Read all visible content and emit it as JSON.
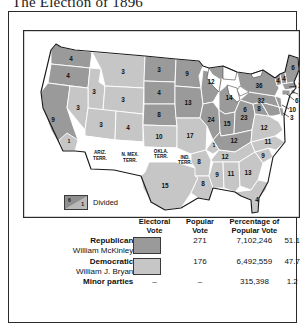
{
  "title": "The Election of 1896",
  "legend": {
    "divided_label": "Divided",
    "divided_swatch_numbers": [
      "6",
      "1"
    ]
  },
  "colors": {
    "republican": "#9a9a9a",
    "democratic": "#c6c6c6",
    "territory": "#ffffff",
    "border": "#2a2a2a",
    "water": "#ffffff"
  },
  "table": {
    "headers": {
      "party": "",
      "electoral_vote": "Electoral Vote",
      "electoral_vote_l1": "Electoral",
      "electoral_vote_l2": "Vote",
      "popular_vote_l1": "Popular",
      "popular_vote_l2": "Vote",
      "percentage_l1": "Percentage of",
      "percentage_l2": "Popular Vote"
    },
    "rows": [
      {
        "party": "Republican",
        "candidate": "William McKinley",
        "swatch": "republican",
        "electoral_vote": "271",
        "popular_vote": "7,102,246",
        "percentage": "51.1"
      },
      {
        "party": "Democratic",
        "candidate": "William J. Bryan",
        "swatch": "democratic",
        "electoral_vote": "176",
        "popular_vote": "6,492,559",
        "percentage": "47.7"
      }
    ],
    "minor": {
      "label": "Minor parties",
      "swatch_dash": "–",
      "electoral_vote": "–",
      "popular_vote": "315,398",
      "percentage": "1.2"
    }
  },
  "map": {
    "type": "electoral-vote-choropleth",
    "states": [
      {
        "code": "WA",
        "votes": "4",
        "party": "republican",
        "x": 57,
        "y": 39
      },
      {
        "code": "OR",
        "votes": "4",
        "party": "republican",
        "x": 43,
        "y": 64
      },
      {
        "code": "ID",
        "votes": "3",
        "party": "democratic",
        "x": 72,
        "y": 66
      },
      {
        "code": "MT",
        "votes": "3",
        "party": "democratic",
        "x": 98,
        "y": 50
      },
      {
        "code": "ND",
        "votes": "3",
        "party": "republican",
        "x": 133,
        "y": 46
      },
      {
        "code": "SD",
        "votes": "4",
        "party": "republican",
        "x": 135,
        "y": 68
      },
      {
        "code": "NE",
        "votes": "8",
        "party": "republican",
        "x": 137,
        "y": 90
      },
      {
        "code": "WY",
        "votes": "3",
        "party": "democratic",
        "x": 101,
        "y": 76
      },
      {
        "code": "NV",
        "votes": "3",
        "party": "democratic",
        "x": 55,
        "y": 93
      },
      {
        "code": "UT",
        "votes": "3",
        "party": "democratic",
        "x": 80,
        "y": 100
      },
      {
        "code": "CO",
        "votes": "4",
        "party": "democratic",
        "x": 105,
        "y": 102
      },
      {
        "code": "CA",
        "votes": "9",
        "party": "republican",
        "x": 33,
        "y": 108
      },
      {
        "code": "CA-d",
        "votes": "1",
        "party": "democratic",
        "x": 51,
        "y": 125
      },
      {
        "code": "KS",
        "votes": "10",
        "party": "democratic",
        "x": 137,
        "y": 110
      },
      {
        "code": "MN",
        "votes": "9",
        "party": "republican",
        "x": 163,
        "y": 42
      },
      {
        "code": "IA",
        "votes": "13",
        "party": "republican",
        "x": 165,
        "y": 78
      },
      {
        "code": "MO",
        "votes": "17",
        "party": "democratic",
        "x": 168,
        "y": 110
      },
      {
        "code": "WI",
        "votes": "12",
        "party": "republican",
        "x": 182,
        "y": 48
      },
      {
        "code": "IL",
        "votes": "24",
        "party": "republican",
        "x": 187,
        "y": 88
      },
      {
        "code": "MI",
        "votes": "14",
        "party": "republican",
        "x": 208,
        "y": 66
      },
      {
        "code": "IN",
        "votes": "15",
        "party": "republican",
        "x": 203,
        "y": 92
      },
      {
        "code": "OH",
        "votes": "23",
        "party": "republican",
        "x": 220,
        "y": 89
      },
      {
        "code": "KY",
        "votes": "12",
        "party": "republican",
        "x": 208,
        "y": 116
      },
      {
        "code": "KY-d",
        "votes": "1",
        "party": "democratic",
        "x": 193,
        "y": 114
      },
      {
        "code": "TN",
        "votes": "12",
        "party": "democratic",
        "x": 198,
        "y": 129
      },
      {
        "code": "TX",
        "votes": "15",
        "party": "democratic",
        "x": 140,
        "y": 160
      },
      {
        "code": "AR",
        "votes": "8",
        "party": "democratic",
        "x": 176,
        "y": 136
      },
      {
        "code": "LA",
        "votes": "8",
        "party": "democratic",
        "x": 179,
        "y": 158
      },
      {
        "code": "MS",
        "votes": "9",
        "party": "democratic",
        "x": 195,
        "y": 152
      },
      {
        "code": "AL",
        "votes": "11",
        "party": "democratic",
        "x": 209,
        "y": 150
      },
      {
        "code": "GA",
        "votes": "13",
        "party": "democratic",
        "x": 225,
        "y": 148
      },
      {
        "code": "SC",
        "votes": "9",
        "party": "democratic",
        "x": 238,
        "y": 137
      },
      {
        "code": "NC",
        "votes": "11",
        "party": "democratic",
        "x": 243,
        "y": 124
      },
      {
        "code": "VA",
        "votes": "12",
        "party": "democratic",
        "x": 240,
        "y": 110
      },
      {
        "code": "WV",
        "votes": "6",
        "party": "republican",
        "x": 223,
        "y": 108
      },
      {
        "code": "MD",
        "votes": "8",
        "party": "republican",
        "x": 243,
        "y": 100
      },
      {
        "code": "FL",
        "votes": "4",
        "party": "democratic",
        "x": 236,
        "y": 174
      },
      {
        "code": "PA",
        "votes": "32",
        "party": "republican",
        "x": 238,
        "y": 84
      },
      {
        "code": "NY",
        "votes": "36",
        "party": "republican",
        "x": 238,
        "y": 62
      },
      {
        "code": "ME",
        "votes": "6",
        "party": "republican",
        "x": 272,
        "y": 37
      },
      {
        "code": "NH",
        "votes": "4",
        "party": "republican",
        "x": 262,
        "y": 52
      },
      {
        "code": "VT",
        "votes": "4",
        "party": "republican",
        "x": 253,
        "y": 51
      },
      {
        "code": "MA",
        "votes": "15",
        "party": "republican",
        "x": 282,
        "y": 60
      },
      {
        "code": "RI",
        "votes": "4",
        "party": "republican",
        "x": 282,
        "y": 71
      },
      {
        "code": "CT",
        "votes": "6",
        "party": "republican",
        "x": 277,
        "y": 78
      },
      {
        "code": "NJ",
        "votes": "10",
        "party": "republican",
        "x": 272,
        "y": 87
      },
      {
        "code": "DE",
        "votes": "3",
        "party": "republican",
        "x": 270,
        "y": 95
      }
    ],
    "territories": [
      {
        "name_l1": "ARIZ.",
        "name_l2": "TERR.",
        "x": 75,
        "y": 132
      },
      {
        "name_l1": "N. MEX.",
        "name_l2": "TERR.",
        "x": 109,
        "y": 135
      },
      {
        "name_l1": "OKLA.",
        "name_l2": "TERR.",
        "x": 142,
        "y": 129
      },
      {
        "name_l1": "IND.",
        "name_l2": "TERR.",
        "x": 163,
        "y": 133
      }
    ]
  }
}
